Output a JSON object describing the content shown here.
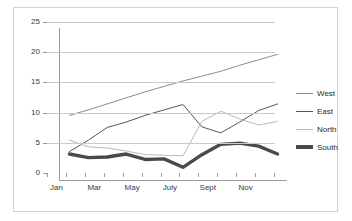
{
  "chart_data": {
    "type": "line",
    "title": "",
    "xlabel": "",
    "ylabel": "",
    "ylim": [
      0,
      25
    ],
    "ytick_values": [
      0,
      5,
      10,
      15,
      20,
      25
    ],
    "ytick_labels": [
      "0",
      "5",
      "10",
      "15",
      "20",
      "25"
    ],
    "grid": true,
    "grid_axis": "y",
    "legend_position": "right",
    "categories": [
      "Jan",
      "Feb",
      "Mar",
      "Apr",
      "May",
      "June",
      "July",
      "Aug",
      "Sept",
      "Oct",
      "Nov",
      "Dec"
    ],
    "xtick_labels": [
      "Jan",
      "",
      "Mar",
      "",
      "May",
      "",
      "July",
      "",
      "Sept",
      "",
      "Nov",
      ""
    ],
    "series": [
      {
        "name": "West",
        "color": "#8c8c8c",
        "width": 1,
        "values": [
          10.7,
          11.6,
          12.6,
          13.6,
          14.6,
          15.5,
          16.4,
          17.2,
          18.0,
          19.0,
          19.9,
          20.8
        ]
      },
      {
        "name": "East",
        "color": "#555555",
        "width": 1,
        "values": [
          4.7,
          6.6,
          8.7,
          9.6,
          10.7,
          11.6,
          12.5,
          8.8,
          7.8,
          9.6,
          11.5,
          12.6
        ]
      },
      {
        "name": "North",
        "color": "#b9b9b9",
        "width": 1,
        "values": [
          6.6,
          5.5,
          5.3,
          4.8,
          4.2,
          4.1,
          4.0,
          9.7,
          11.4,
          10.1,
          9.1,
          9.7
        ]
      },
      {
        "name": "South",
        "color": "#4a4a4a",
        "width": 3.4,
        "values": [
          4.3,
          3.7,
          3.8,
          4.3,
          3.4,
          3.5,
          2.1,
          4.2,
          5.9,
          6.1,
          5.6,
          4.3
        ]
      }
    ]
  }
}
